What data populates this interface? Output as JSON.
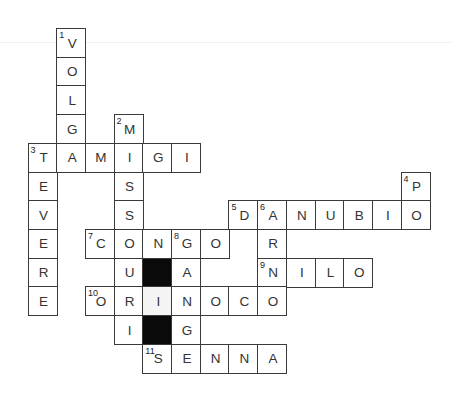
{
  "puzzle": {
    "type": "crossword",
    "cell_size": 28.7,
    "origin": {
      "x": 27.5,
      "y": 28
    },
    "words": [
      {
        "number": 1,
        "direction": "down",
        "answer": "VOLGA"
      },
      {
        "number": 2,
        "direction": "down",
        "answer": "MISSOURI"
      },
      {
        "number": 3,
        "direction": "across",
        "answer": "TAMIGI"
      },
      {
        "number": 3,
        "direction": "down",
        "answer": "TEVERE"
      },
      {
        "number": 4,
        "direction": "down",
        "answer": "PO"
      },
      {
        "number": 5,
        "direction": "across",
        "answer": "DANUBIO"
      },
      {
        "number": 6,
        "direction": "down",
        "answer": "ARNO"
      },
      {
        "number": 7,
        "direction": "across",
        "answer": "CONGO"
      },
      {
        "number": 8,
        "direction": "down",
        "answer": "GANGE"
      },
      {
        "number": 9,
        "direction": "across",
        "answer": "NILO"
      },
      {
        "number": 10,
        "direction": "across",
        "answer": "ORINOCO"
      },
      {
        "number": 11,
        "direction": "across",
        "answer": "SENNA"
      }
    ],
    "cells": [
      {
        "c": 1,
        "r": 0,
        "l": "V",
        "n": "1"
      },
      {
        "c": 1,
        "r": 1,
        "l": "O"
      },
      {
        "c": 1,
        "r": 2,
        "l": "L"
      },
      {
        "c": 1,
        "r": 3,
        "l": "G"
      },
      {
        "c": 3,
        "r": 3,
        "l": "M",
        "n": "2"
      },
      {
        "c": 0,
        "r": 4,
        "l": "T",
        "n": "3"
      },
      {
        "c": 1,
        "r": 4,
        "l": "A"
      },
      {
        "c": 2,
        "r": 4,
        "l": "M"
      },
      {
        "c": 3,
        "r": 4,
        "l": "I"
      },
      {
        "c": 4,
        "r": 4,
        "l": "G"
      },
      {
        "c": 5,
        "r": 4,
        "l": "I"
      },
      {
        "c": 0,
        "r": 5,
        "l": "E"
      },
      {
        "c": 3,
        "r": 5,
        "l": "S"
      },
      {
        "c": 13,
        "r": 5,
        "l": "P",
        "n": "4"
      },
      {
        "c": 0,
        "r": 6,
        "l": "V"
      },
      {
        "c": 3,
        "r": 6,
        "l": "S"
      },
      {
        "c": 7,
        "r": 6,
        "l": "D",
        "n": "5"
      },
      {
        "c": 8,
        "r": 6,
        "l": "A",
        "n": "6"
      },
      {
        "c": 9,
        "r": 6,
        "l": "N"
      },
      {
        "c": 10,
        "r": 6,
        "l": "U"
      },
      {
        "c": 11,
        "r": 6,
        "l": "B"
      },
      {
        "c": 12,
        "r": 6,
        "l": "I"
      },
      {
        "c": 13,
        "r": 6,
        "l": "O"
      },
      {
        "c": 0,
        "r": 7,
        "l": "E"
      },
      {
        "c": 2,
        "r": 7,
        "l": "C",
        "n": "7"
      },
      {
        "c": 3,
        "r": 7,
        "l": "O"
      },
      {
        "c": 4,
        "r": 7,
        "l": "N"
      },
      {
        "c": 5,
        "r": 7,
        "l": "G",
        "n": "8"
      },
      {
        "c": 6,
        "r": 7,
        "l": "O"
      },
      {
        "c": 8,
        "r": 7,
        "l": "R"
      },
      {
        "c": 0,
        "r": 8,
        "l": "R"
      },
      {
        "c": 3,
        "r": 8,
        "l": "U"
      },
      {
        "c": 4,
        "r": 8,
        "l": "",
        "black": true
      },
      {
        "c": 5,
        "r": 8,
        "l": "A"
      },
      {
        "c": 8,
        "r": 8,
        "l": "N",
        "n": "9"
      },
      {
        "c": 9,
        "r": 8,
        "l": "I"
      },
      {
        "c": 10,
        "r": 8,
        "l": "L"
      },
      {
        "c": 11,
        "r": 8,
        "l": "O"
      },
      {
        "c": 0,
        "r": 9,
        "l": "E"
      },
      {
        "c": 2,
        "r": 9,
        "l": "O",
        "n": "10"
      },
      {
        "c": 3,
        "r": 9,
        "l": "R"
      },
      {
        "c": 4,
        "r": 9,
        "l": "I",
        "shade": true
      },
      {
        "c": 5,
        "r": 9,
        "l": "N"
      },
      {
        "c": 6,
        "r": 9,
        "l": "O"
      },
      {
        "c": 7,
        "r": 9,
        "l": "C"
      },
      {
        "c": 8,
        "r": 9,
        "l": "O"
      },
      {
        "c": 3,
        "r": 10,
        "l": "I"
      },
      {
        "c": 4,
        "r": 10,
        "l": "",
        "black": true
      },
      {
        "c": 5,
        "r": 10,
        "l": "G"
      },
      {
        "c": 4,
        "r": 11,
        "l": "S",
        "n": "11"
      },
      {
        "c": 5,
        "r": 11,
        "l": "E"
      },
      {
        "c": 6,
        "r": 11,
        "l": "N"
      },
      {
        "c": 7,
        "r": 11,
        "l": "N"
      },
      {
        "c": 8,
        "r": 11,
        "l": "A"
      }
    ]
  }
}
